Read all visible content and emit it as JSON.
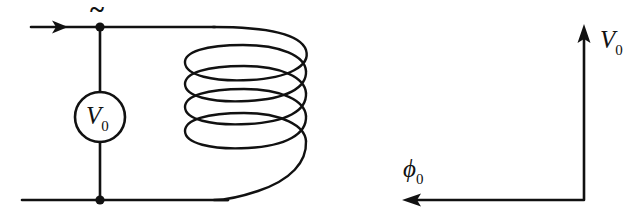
{
  "figure": {
    "background_color": "#ffffff",
    "ink_color": "#111111",
    "width": 644,
    "height": 223
  },
  "circuit": {
    "source": {
      "symbol_name": "ac-voltage-source",
      "label_main": "V",
      "label_sub": "0",
      "ac_marker": "~",
      "circle_center_x": 100,
      "circle_center_y": 117,
      "circle_radius": 25
    },
    "top_node": {
      "x": 100,
      "y": 27
    },
    "bottom_node": {
      "x": 100,
      "y": 200
    },
    "current_arrow": {
      "direction": "right",
      "tip_x": 68,
      "y": 27
    },
    "coil": {
      "name": "inductor-coil",
      "turns": 4,
      "left_x": 185,
      "right_x": 306,
      "top_y": 27,
      "bottom_y": 200
    }
  },
  "axes": {
    "vertical": {
      "label_main": "V",
      "label_sub": "0",
      "direction": "up",
      "x": 584,
      "y_bottom": 200,
      "y_tip": 26
    },
    "horizontal": {
      "label_main": "ϕ",
      "label_sub": "0",
      "direction": "left",
      "y": 200,
      "x_right": 584,
      "x_tip": 402
    }
  }
}
